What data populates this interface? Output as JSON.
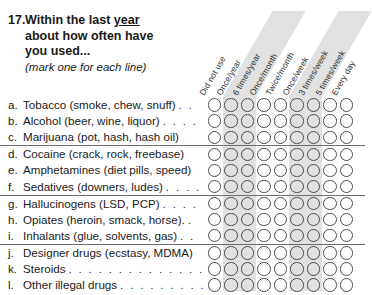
{
  "question": {
    "number": "17.",
    "line1_pre": "Within the last ",
    "line1_underlined": "year",
    "line2": "about how often have",
    "line3": "you used...",
    "instruction": "(mark one for each line)"
  },
  "columns": [
    {
      "label": "Did not use",
      "shaded": false
    },
    {
      "label": "Once/year",
      "shaded": true
    },
    {
      "label": "6 times/year",
      "shaded": true
    },
    {
      "label": "Once/month",
      "shaded": false
    },
    {
      "label": "Twice/month",
      "shaded": false
    },
    {
      "label": "Once/week",
      "shaded": true
    },
    {
      "label": "3 times/week",
      "shaded": true
    },
    {
      "label": "5 times/week",
      "shaded": false
    },
    {
      "label": "Every day",
      "shaded": false
    }
  ],
  "rows": [
    {
      "letter": "a.",
      "text": "Tobacco (smoke, chew, snuff)",
      "leader": ". .",
      "rule_above": false
    },
    {
      "letter": "b.",
      "text": "Alcohol (beer, wine, liquor)",
      "leader": ". . . .",
      "rule_above": false
    },
    {
      "letter": "c.",
      "text": "Marijuana (pot, hash, hash oil)",
      "leader": "",
      "rule_above": false
    },
    {
      "letter": "d.",
      "text": "Cocaine (crack, rock, freebase)",
      "leader": "",
      "rule_above": true
    },
    {
      "letter": "e.",
      "text": "Amphetamines (diet pills, speed)",
      "leader": "",
      "rule_above": false
    },
    {
      "letter": "f.",
      "text": "Sedatives (downers, ludes)",
      "leader": ". . . .",
      "rule_above": false
    },
    {
      "letter": "g.",
      "text": "Hallucinogens (LSD, PCP)",
      "leader": ". . . .",
      "rule_above": true
    },
    {
      "letter": "h.",
      "text": "Opiates (heroin, smack, horse).",
      "leader": ".",
      "rule_above": false
    },
    {
      "letter": "i.",
      "text": "Inhalants (glue, solvents, gas)",
      "leader": ". .",
      "rule_above": false
    },
    {
      "letter": "j.",
      "text": "Designer drugs (ecstasy, MDMA)",
      "leader": "",
      "rule_above": true
    },
    {
      "letter": "k.",
      "text": "Steroids",
      "leader": ". . . . . . . . . . . . . . .",
      "rule_above": false
    },
    {
      "letter": "l.",
      "text": "Other illegal drugs",
      "leader": ". . . . . . . . . .",
      "rule_above": false
    }
  ],
  "colors": {
    "band": "#dcdcdc",
    "bubble_border": "#4a4a4a",
    "rule": "#6e6e6e",
    "text": "#1a1a1a",
    "background": "#ffffff"
  }
}
